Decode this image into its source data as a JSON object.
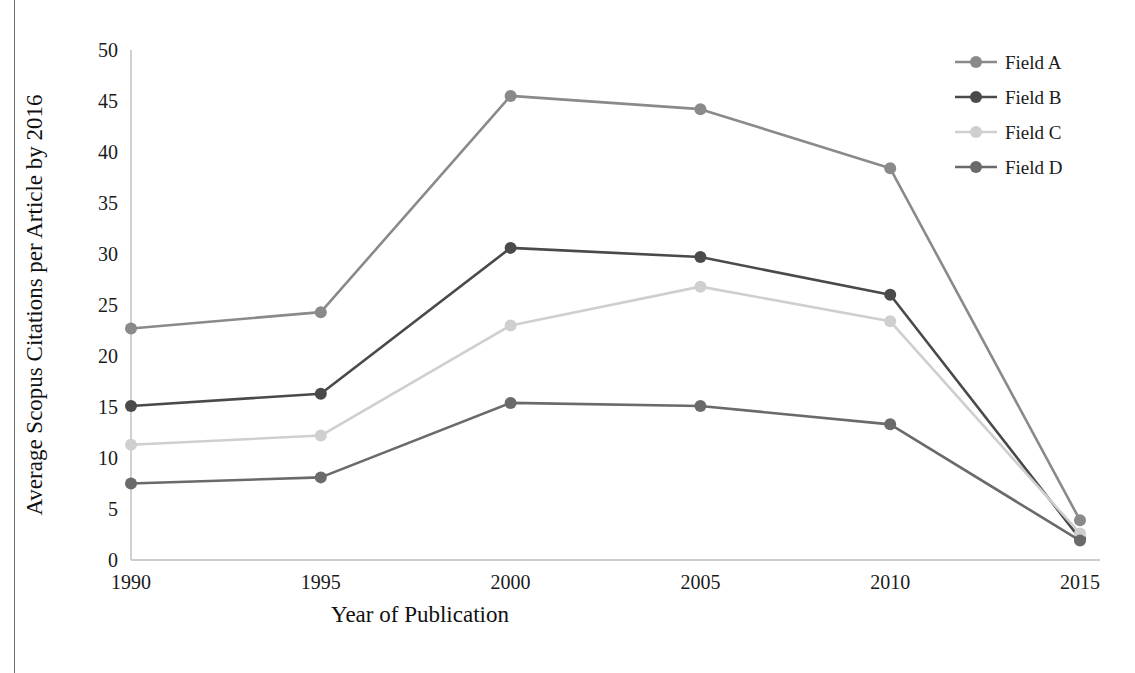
{
  "chart_data": {
    "type": "line",
    "title": "",
    "xlabel": "Year of Publication",
    "ylabel": "Average Scopus Citations per Article by 2016",
    "categories": [
      "1990",
      "1995",
      "2000",
      "2005",
      "2010",
      "2015"
    ],
    "x": [
      1990,
      1995,
      2000,
      2005,
      2010,
      2015
    ],
    "ylim": [
      0,
      50
    ],
    "xlim": [
      1990,
      2015
    ],
    "yticks": [
      "0",
      "5",
      "10",
      "15",
      "20",
      "25",
      "30",
      "35",
      "40",
      "45",
      "50"
    ],
    "ytick_values": [
      0,
      5,
      10,
      15,
      20,
      25,
      30,
      35,
      40,
      45,
      50
    ],
    "xticks": [
      "1990",
      "1995",
      "2000",
      "2005",
      "2010",
      "2015"
    ],
    "grid": false,
    "legend_position": "top-right",
    "markers": "circle",
    "series": [
      {
        "name": "Field A",
        "color": "#8a8a8a",
        "values": [
          22.7,
          24.3,
          45.5,
          44.2,
          38.4,
          3.9
        ]
      },
      {
        "name": "Field B",
        "color": "#4a4a4a",
        "values": [
          15.1,
          16.3,
          30.6,
          29.7,
          26.0,
          2.1
        ]
      },
      {
        "name": "Field C",
        "color": "#cfcfcf",
        "values": [
          11.3,
          12.2,
          23.0,
          26.8,
          23.4,
          2.6
        ]
      },
      {
        "name": "Field D",
        "color": "#6a6a6a",
        "values": [
          7.5,
          8.1,
          15.4,
          15.1,
          13.3,
          1.9
        ]
      }
    ]
  },
  "legend": {
    "entries": [
      {
        "label": "Field A",
        "color": "#8a8a8a"
      },
      {
        "label": "Field B",
        "color": "#4a4a4a"
      },
      {
        "label": "Field C",
        "color": "#cfcfcf"
      },
      {
        "label": "Field D",
        "color": "#6a6a6a"
      }
    ]
  },
  "axes": {
    "y_title": "Average Scopus Citations per Article by 2016",
    "x_title": "Year of Publication"
  }
}
